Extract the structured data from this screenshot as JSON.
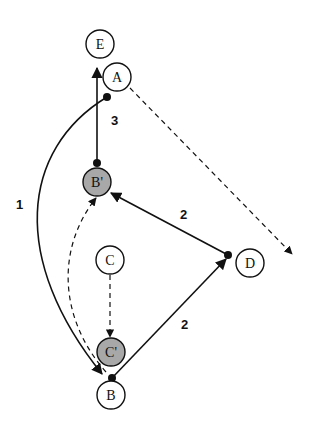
{
  "colors": {
    "stroke": "#111111",
    "node_fill": "#ffffff",
    "shaded_fill": "#a8a8a8",
    "background": "#ffffff"
  },
  "nodes": {
    "E": {
      "label": "E",
      "cx": 100,
      "cy": 44,
      "shaded": false
    },
    "A": {
      "label": "A",
      "cx": 117,
      "cy": 77,
      "shaded": false
    },
    "Bp": {
      "label": "B'",
      "cx": 97,
      "cy": 182,
      "shaded": true
    },
    "C": {
      "label": "C",
      "cx": 110,
      "cy": 260,
      "shaded": false
    },
    "D": {
      "label": "D",
      "cx": 250,
      "cy": 263,
      "shaded": false
    },
    "Cp": {
      "label": "C'",
      "cx": 111,
      "cy": 352,
      "shaded": true
    },
    "B": {
      "label": "B",
      "cx": 111,
      "cy": 395,
      "shaded": false
    }
  },
  "edges": [
    {
      "id": "bp-to-e",
      "from": "B'",
      "to": "E",
      "style": "solid",
      "label": "3"
    },
    {
      "id": "a-to-b",
      "from": "A",
      "to": "B",
      "style": "solid",
      "label": "1"
    },
    {
      "id": "a-to-offscreen",
      "from": "A",
      "to": "(right)",
      "style": "dashed",
      "label": ""
    },
    {
      "id": "d-to-bp",
      "from": "D",
      "to": "B'",
      "style": "solid",
      "label": "2"
    },
    {
      "id": "b-to-d",
      "from": "B",
      "to": "D",
      "style": "solid",
      "label": "2"
    },
    {
      "id": "c-to-cp",
      "from": "C",
      "to": "C'",
      "style": "dashed",
      "label": ""
    },
    {
      "id": "b-to-bp",
      "from": "B",
      "to": "B'",
      "style": "dashed",
      "label": ""
    }
  ],
  "edge_labels": {
    "one": "1",
    "two_upper": "2",
    "two_lower": "2",
    "three": "3"
  }
}
